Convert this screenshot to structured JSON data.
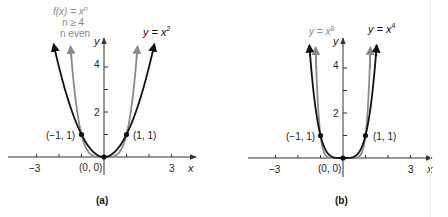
{
  "colors": {
    "black_curve": "#111111",
    "gray_curve": "#8a8a8a",
    "axis": "#333333",
    "label_text": "#222222",
    "gray_text": "#8a8a8a",
    "right_border": "#ececec"
  },
  "chart_data": [
    {
      "type": "line",
      "panel_label": "(a)",
      "title": "",
      "xlabel": "x",
      "ylabel": "y",
      "xlim": [
        -4.2,
        4.0
      ],
      "ylim": [
        -2.0,
        5.5
      ],
      "x_ticks": [
        -3,
        -2,
        -1,
        1,
        2,
        3
      ],
      "x_tick_labels": [
        {
          "value": -3,
          "label": "−3"
        },
        {
          "value": 3,
          "label": "3"
        }
      ],
      "y_ticks": [
        1,
        2,
        3,
        4
      ],
      "y_tick_labels": [
        {
          "value": 2,
          "label": "2"
        },
        {
          "value": 4,
          "label": "4"
        }
      ],
      "grid": false,
      "series": [
        {
          "name": "y = x^2",
          "exponent": 2,
          "color": "black",
          "label_text": "y = x",
          "label_sup": "2",
          "arrow_y_max": 5.0
        },
        {
          "name": "f(x) = x^n, n ≥ 4, n even",
          "exponent": 4,
          "color": "gray",
          "label_lines": [
            "f(x) = x",
            "n ≥ 4",
            "n even"
          ],
          "label_sup": "n",
          "arrow_y_max": 4.9
        }
      ],
      "points": [
        {
          "x": -1,
          "y": 1,
          "label": "(−1, 1)"
        },
        {
          "x": 0,
          "y": 0,
          "label": "(0, 0)"
        },
        {
          "x": 1,
          "y": 1,
          "label": "(1, 1)"
        }
      ]
    },
    {
      "type": "line",
      "panel_label": "(b)",
      "title": "",
      "xlabel": "x",
      "ylabel": "y",
      "xlim": [
        -4.2,
        4.0
      ],
      "ylim": [
        -2.0,
        5.5
      ],
      "x_ticks": [
        -3,
        -2,
        -1,
        1,
        2,
        3
      ],
      "x_tick_labels": [
        {
          "value": -3,
          "label": "−3"
        },
        {
          "value": 3,
          "label": "3"
        }
      ],
      "y_ticks": [
        1,
        2,
        3,
        4
      ],
      "y_tick_labels": [
        {
          "value": 2,
          "label": "2"
        },
        {
          "value": 4,
          "label": "4"
        }
      ],
      "grid": false,
      "series": [
        {
          "name": "y = x^4",
          "exponent": 4,
          "color": "black",
          "label_text": "y = x",
          "label_sup": "4",
          "arrow_y_max": 5.0
        },
        {
          "name": "y = x^8",
          "exponent": 8,
          "color": "gray",
          "label_text": "y = x",
          "label_sup": "8",
          "arrow_y_max": 4.9
        }
      ],
      "points": [
        {
          "x": -1,
          "y": 1,
          "label": "(−1, 1)"
        },
        {
          "x": 0,
          "y": 0,
          "label": "(0, 0)"
        },
        {
          "x": 1,
          "y": 1,
          "label": "(1, 1)"
        }
      ]
    }
  ],
  "panels": {
    "a": {
      "panel_label": "(a)",
      "x_axis_label": "x",
      "y_axis_label": "y",
      "tick_neg3": "−3",
      "tick_3": "3",
      "tick_2": "2",
      "tick_4": "4",
      "point_neg": "(−1, 1)",
      "point_pos": "(1, 1)",
      "point_origin": "(0, 0)",
      "black_label": "y = x",
      "black_sup": "2",
      "gray_label_line1": "f(x) = x",
      "gray_label_sup": "n",
      "gray_label_line2": "n ≥ 4",
      "gray_label_line3": "n even"
    },
    "b": {
      "panel_label": "(b)",
      "x_axis_label": "x",
      "y_axis_label": "y",
      "tick_neg3": "−3",
      "tick_3": "3",
      "tick_2": "2",
      "tick_4": "4",
      "point_neg": "(−1, 1)",
      "point_pos": "(1, 1)",
      "point_origin": "(0, 0)",
      "black_label": "y = x",
      "black_sup": "4",
      "gray_label": "y = x",
      "gray_sup": "8"
    }
  }
}
